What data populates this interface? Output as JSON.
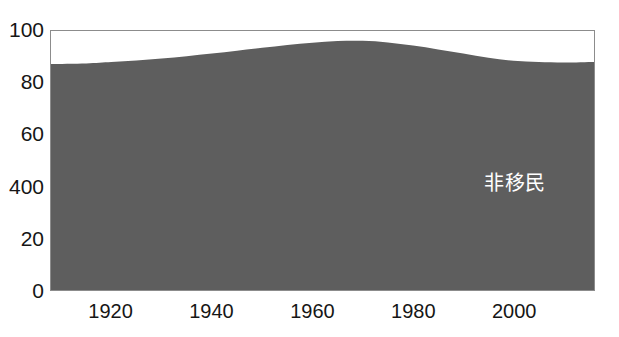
{
  "title": {
    "text": "",
    "visible": false,
    "note": "top text line is cropped off at the image edge and is illegible"
  },
  "colors": {
    "area_fill": "#5e5e5e",
    "frame": "#8c8c8c",
    "background": "#ffffff",
    "label_text": "#161616",
    "series_label_text": "#ffffff"
  },
  "axes": {
    "y_ticks": [
      "100",
      "80",
      "60",
      "400",
      "20",
      "0"
    ],
    "x_ticks": [
      "1920",
      "1940",
      "1960",
      "1980",
      "2000"
    ]
  },
  "series_label": "非移民",
  "chart_data": {
    "type": "area",
    "title": "",
    "xlabel": "",
    "ylabel": "",
    "xlim": [
      1908,
      2016
    ],
    "ylim": [
      0,
      100
    ],
    "grid": false,
    "legend": "none",
    "x_tick_labels": [
      "1920",
      "1940",
      "1960",
      "1980",
      "2000"
    ],
    "x_tick_values": [
      1920,
      1940,
      1960,
      1980,
      2000
    ],
    "y_tick_labels": [
      "0",
      "20",
      "400",
      "60",
      "80",
      "100"
    ],
    "y_tick_values": [
      0,
      20,
      40,
      60,
      80,
      100
    ],
    "y_tick_note": "the 40 gridline is printed as '400' in the source image",
    "series": [
      {
        "name": "非移民",
        "color": "#5e5e5e",
        "x": [
          1908,
          1915,
          1920,
          1925,
          1930,
          1935,
          1940,
          1945,
          1950,
          1955,
          1960,
          1965,
          1970,
          1975,
          1980,
          1985,
          1990,
          1995,
          2000,
          2005,
          2010,
          2016
        ],
        "values": [
          87.3,
          87.5,
          88.0,
          88.6,
          89.4,
          90.3,
          91.3,
          92.4,
          93.5,
          94.6,
          95.5,
          96.1,
          96.2,
          95.6,
          94.4,
          92.9,
          91.3,
          89.7,
          88.5,
          88.0,
          87.8,
          88.0
        ]
      }
    ],
    "annotations": [
      {
        "text": "非移民",
        "x": 1994,
        "y": 45,
        "color": "#ffffff"
      }
    ]
  }
}
